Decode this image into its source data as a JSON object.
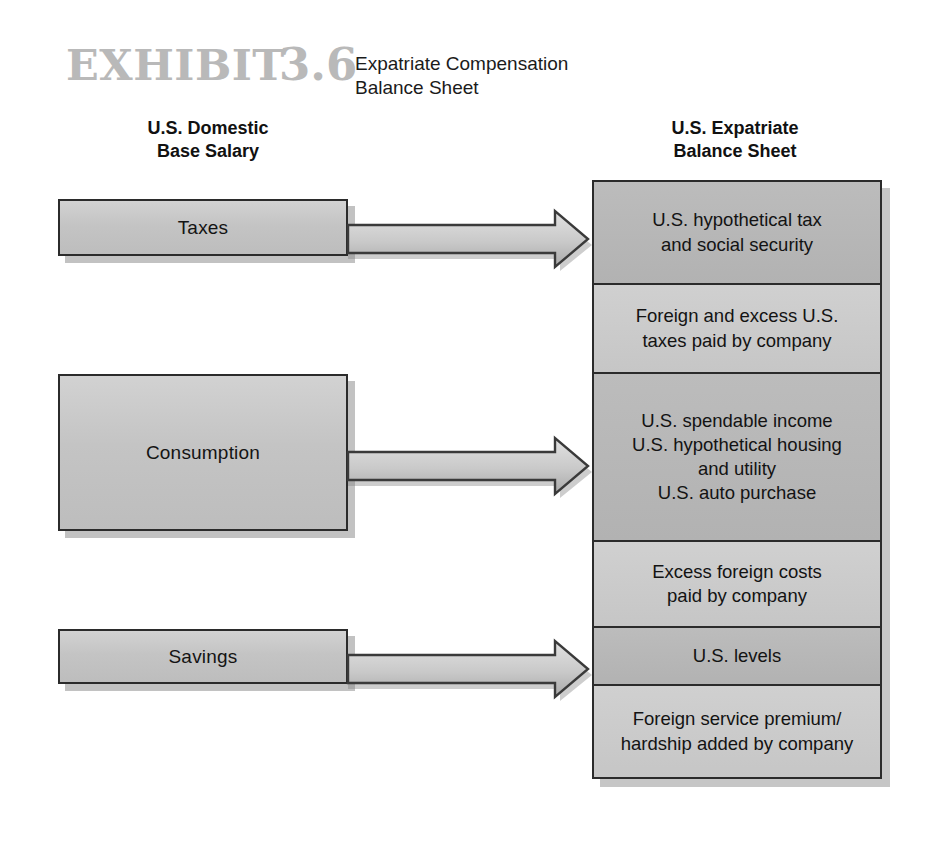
{
  "exhibit": {
    "label": "EXHIBIT",
    "number": "3.6",
    "title": "Expatriate Compensation\nBalance Sheet"
  },
  "columns": {
    "left_heading": "U.S. Domestic\nBase Salary",
    "right_heading": "U.S. Expatriate\nBalance Sheet"
  },
  "left_boxes": [
    {
      "label": "Taxes"
    },
    {
      "label": "Consumption"
    },
    {
      "label": "Savings"
    }
  ],
  "right_boxes": [
    {
      "label": "U.S. hypothetical tax\nand social security",
      "shade": "dark"
    },
    {
      "label": "Foreign and excess U.S.\ntaxes paid by company",
      "shade": "light"
    },
    {
      "label": "U.S. spendable income\nU.S. hypothetical housing\nand utility\nU.S. auto purchase",
      "shade": "dark"
    },
    {
      "label": "Excess foreign costs\npaid by company",
      "shade": "light"
    },
    {
      "label": "U.S. levels",
      "shade": "dark"
    },
    {
      "label": "Foreign service premium/\nhardship added by company",
      "shade": "light"
    }
  ],
  "arrows": [
    {
      "name": "arrow-taxes",
      "from": "Taxes",
      "to": "U.S. hypothetical tax and social security"
    },
    {
      "name": "arrow-consumption",
      "from": "Consumption",
      "to": "U.S. spendable income"
    },
    {
      "name": "arrow-savings",
      "from": "Savings",
      "to": "U.S. levels"
    }
  ],
  "colors": {
    "exhibit_label": "#b9b9b9",
    "box_border": "#2b2b2b",
    "box_dark": "#b5b5b5",
    "box_light": "#c8c8c8",
    "text": "#131313",
    "page_background": "#ffffff"
  }
}
